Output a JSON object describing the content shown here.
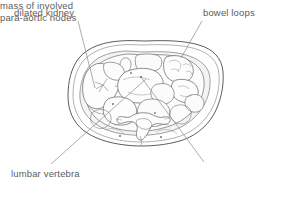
{
  "figure": {
    "type": "medical-line-diagram",
    "background_color": "#ffffff",
    "line_color": "#555555",
    "text_color": "#5d5d5d",
    "shading_color": "#e9e9e9"
  },
  "labels": {
    "dilated_kidney": "dilated kidney",
    "bowel_loops": "bowel loops",
    "lumbar_vertebra": "lumbar vertebra",
    "mass_nodes_line1": "mass of involved",
    "mass_nodes_line2": "para-aortic nodes"
  },
  "leaders": [
    {
      "name": "dilated-kidney-leader",
      "from": [
        78,
        21
      ],
      "to": [
        95,
        88
      ]
    },
    {
      "name": "bowel-loops-leader",
      "from": [
        202,
        21
      ],
      "to": [
        181,
        58
      ]
    },
    {
      "name": "lumbar-vertebra-leader",
      "from": [
        51,
        164
      ],
      "to": [
        146,
        79
      ]
    },
    {
      "name": "para-aortic-nodes-leader",
      "from": [
        204,
        162
      ],
      "to": [
        141,
        77
      ]
    }
  ]
}
